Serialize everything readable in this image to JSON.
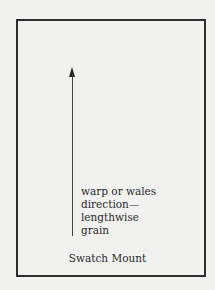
{
  "diagram": {
    "title": "Swatch Mount",
    "arrow": {
      "direction": "up",
      "label_lines": [
        "warp or wales",
        "direction—",
        "lengthwise",
        "grain"
      ]
    },
    "colors": {
      "background": "#f1f1f0",
      "border": "#2e2e2e",
      "text": "#2a2a2a"
    }
  }
}
